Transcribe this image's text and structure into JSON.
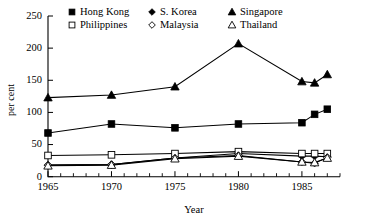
{
  "chart_data": {
    "type": "line",
    "title": "",
    "xlabel": "Year",
    "ylabel": "per cent",
    "xlim": [
      1965,
      1988
    ],
    "ylim": [
      0,
      250
    ],
    "yticks": [
      0,
      50,
      100,
      150,
      200,
      250
    ],
    "xticks": [
      1965,
      1970,
      1975,
      1980,
      1985
    ],
    "xtick_labels": [
      "1965",
      "1970",
      "1975",
      "1980",
      "1985"
    ],
    "minor_xticks_every": 1,
    "grid": false,
    "legend_position": "top-inside",
    "series": [
      {
        "name": "Hong Kong",
        "marker": "filled-square",
        "x": [
          1965,
          1970,
          1975,
          1980,
          1985,
          1986,
          1987
        ],
        "values": [
          68,
          82,
          76,
          82,
          84,
          97,
          105
        ]
      },
      {
        "name": "S. Korea",
        "marker": "filled-diamond",
        "x": [
          1965,
          1970,
          1975,
          1980,
          1985,
          1986,
          1987
        ],
        "values": [
          18,
          19,
          29,
          36,
          32,
          32,
          31
        ]
      },
      {
        "name": "Singapore",
        "marker": "filled-triangle",
        "x": [
          1965,
          1970,
          1975,
          1980,
          1985,
          1986,
          1987
        ],
        "values": [
          123,
          127,
          140,
          207,
          148,
          146,
          159
        ]
      },
      {
        "name": "Philippines",
        "marker": "open-square",
        "x": [
          1965,
          1970,
          1975,
          1980,
          1985,
          1986,
          1987
        ],
        "values": [
          33,
          34,
          36,
          39,
          36,
          36,
          36
        ]
      },
      {
        "name": "Malaysia",
        "marker": "open-diamond",
        "x": [
          1965,
          1970,
          1975,
          1980,
          1985,
          1986,
          1987
        ],
        "values": [
          18,
          19,
          29,
          33,
          23,
          21,
          30
        ]
      },
      {
        "name": "Thailand",
        "marker": "open-triangle",
        "x": [
          1965,
          1970,
          1975,
          1980,
          1985,
          1986,
          1987
        ],
        "values": [
          17,
          18,
          28,
          32,
          23,
          22,
          29
        ]
      }
    ],
    "legend_rows": [
      [
        {
          "label": "Hong Kong",
          "marker": "filled-square"
        },
        {
          "label": "S. Korea",
          "marker": "filled-diamond"
        },
        {
          "label": "Singapore",
          "marker": "filled-triangle"
        }
      ],
      [
        {
          "label": "Philippines",
          "marker": "open-square"
        },
        {
          "label": "Malaysia",
          "marker": "open-diamond"
        },
        {
          "label": "Thailand",
          "marker": "open-triangle"
        }
      ]
    ],
    "colors": {
      "ink": "#000000",
      "background": "#ffffff"
    }
  }
}
